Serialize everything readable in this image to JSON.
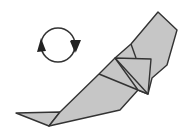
{
  "diagram": {
    "type": "origami-step",
    "symbol": "turn-over",
    "symbol_label": "Turn over",
    "paper_color": "#c6c6c6",
    "line_color": "#333333",
    "background": "#ffffff"
  }
}
